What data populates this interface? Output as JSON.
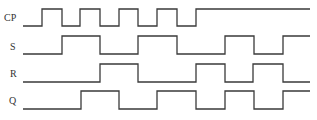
{
  "diagram": {
    "type": "timing-diagram",
    "line_color": "#3a3a3a",
    "label_color": "#333333",
    "x_start": 23,
    "x_end": 310,
    "signals": [
      {
        "name": "CP",
        "label_x": 4,
        "label_y": 21,
        "high_y": 9,
        "low_y": 26,
        "initial": 0,
        "transitions": [
          42,
          62,
          80,
          100,
          119,
          138,
          157,
          177,
          196
        ]
      },
      {
        "name": "S",
        "label_x": 10,
        "label_y": 50,
        "high_y": 36,
        "low_y": 54,
        "initial": 0,
        "transitions": [
          62,
          100,
          138,
          177,
          225,
          254,
          283
        ]
      },
      {
        "name": "R",
        "label_x": 10,
        "label_y": 77,
        "high_y": 64,
        "low_y": 82,
        "initial": 0,
        "transitions": [
          100,
          138,
          196,
          225,
          253,
          283
        ]
      },
      {
        "name": "Q",
        "label_x": 9,
        "label_y": 104,
        "high_y": 91,
        "low_y": 109,
        "initial": 0,
        "transitions": [
          81,
          119,
          157,
          196,
          225,
          254,
          283
        ]
      }
    ]
  }
}
